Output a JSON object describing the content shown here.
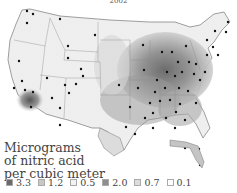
{
  "title": "2002",
  "legend": {
    "title_lines": [
      "Micrograms",
      "of nitric acid",
      "per cubic meter"
    ],
    "items": [
      {
        "label": "3.3",
        "color": "#6a6a6a"
      },
      {
        "label": "1.2",
        "color": "#c8c8c8"
      },
      {
        "label": "0.5",
        "color": "#f2f2f2"
      },
      {
        "label": "2.0",
        "color": "#8e8e8e"
      },
      {
        "label": "0.7",
        "color": "#dcdcdc"
      },
      {
        "label": "0.1",
        "color": "#ffffff"
      }
    ]
  },
  "map": {
    "region": "Contiguous United States",
    "measure": "Nitric acid concentration",
    "marker": "monitoring-site dots",
    "high_regions": [
      "Ohio Valley",
      "Mid-Atlantic",
      "Southern California"
    ],
    "low_regions": [
      "Northwest",
      "Mountain West",
      "Northern Plains"
    ]
  }
}
